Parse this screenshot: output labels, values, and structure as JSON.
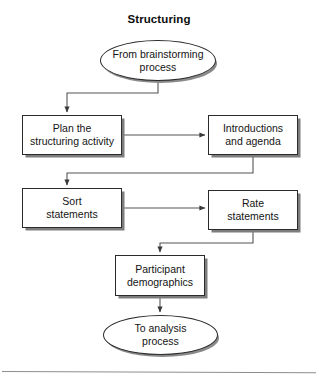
{
  "diagram": {
    "title": "Structuring",
    "type": "flowchart",
    "orientation": "top-to-bottom",
    "colors": {
      "node_fill": "#ffffff",
      "node_stroke": "#2b2b2b",
      "node_shadow": "#7d7d7d",
      "connector": "#555555",
      "text": "#141414",
      "footer_rule": "#8d8d8d"
    },
    "nodes": [
      {
        "id": "from-brainstorming",
        "shape": "ellipse",
        "label": "From brainstorming\nprocess",
        "role": "start-terminator"
      },
      {
        "id": "plan-structuring",
        "shape": "rectangle",
        "label": "Plan the\nstructuring activity",
        "role": "process"
      },
      {
        "id": "introductions",
        "shape": "rectangle",
        "label": "Introductions\nand agenda",
        "role": "process"
      },
      {
        "id": "sort-statements",
        "shape": "rectangle",
        "label": "Sort\nstatements",
        "role": "process"
      },
      {
        "id": "rate-statements",
        "shape": "rectangle",
        "label": "Rate\nstatements",
        "role": "process"
      },
      {
        "id": "participant-demographics",
        "shape": "rectangle",
        "label": "Participant\ndemographics",
        "role": "process"
      },
      {
        "id": "to-analysis",
        "shape": "ellipse",
        "label": "To analysis\nprocess",
        "role": "end-terminator"
      }
    ],
    "edges": [
      {
        "id": "edge-1",
        "from": "from-brainstorming",
        "to": "plan-structuring",
        "style": "elbow",
        "arrow": "end"
      },
      {
        "id": "edge-2",
        "from": "plan-structuring",
        "to": "introductions",
        "style": "straight",
        "arrow": "end"
      },
      {
        "id": "edge-3",
        "from": "introductions",
        "to": "sort-statements",
        "style": "elbow",
        "arrow": "end"
      },
      {
        "id": "edge-4",
        "from": "sort-statements",
        "to": "rate-statements",
        "style": "straight",
        "arrow": "end"
      },
      {
        "id": "edge-5",
        "from": "rate-statements",
        "to": "participant-demographics",
        "style": "elbow",
        "arrow": "end"
      },
      {
        "id": "edge-6",
        "from": "participant-demographics",
        "to": "to-analysis",
        "style": "straight",
        "arrow": "end"
      }
    ]
  }
}
